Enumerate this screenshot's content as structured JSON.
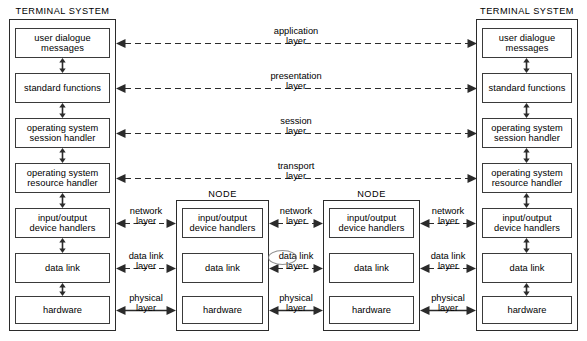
{
  "diagram": {
    "captions": {
      "terminal_system": "TERMINAL SYSTEM",
      "node": "NODE"
    },
    "terminal_stack": [
      {
        "id": "user-dialogue-messages",
        "lines": [
          "user dialogue",
          "messages"
        ]
      },
      {
        "id": "standard-functions",
        "lines": [
          "standard functions"
        ]
      },
      {
        "id": "operating-system-session-handler",
        "lines": [
          "operating system",
          "session handler"
        ]
      },
      {
        "id": "operating-system-resource-handler",
        "lines": [
          "operating system",
          "resource handler"
        ]
      },
      {
        "id": "input-output-device-handlers",
        "lines": [
          "input/output",
          "device handlers"
        ]
      },
      {
        "id": "data-link",
        "lines": [
          "data link"
        ]
      },
      {
        "id": "hardware",
        "lines": [
          "hardware"
        ]
      }
    ],
    "node_stack": [
      {
        "id": "input-output-device-handlers",
        "lines": [
          "input/output",
          "device handlers"
        ]
      },
      {
        "id": "data-link",
        "lines": [
          "data link"
        ]
      },
      {
        "id": "hardware",
        "lines": [
          "hardware"
        ]
      }
    ],
    "end_to_end_layers": [
      {
        "id": "application-layer",
        "l1": "application",
        "l2": "layer"
      },
      {
        "id": "presentation-layer",
        "l1": "presentation",
        "l2": "layer"
      },
      {
        "id": "session-layer",
        "l1": "session",
        "l2": "layer"
      },
      {
        "id": "transport-layer",
        "l1": "transport",
        "l2": "layer"
      }
    ],
    "hop_layers": [
      {
        "id": "network-layer",
        "l1": "network",
        "l2": "layer",
        "style": "dashed"
      },
      {
        "id": "data-link-layer",
        "l1": "data link",
        "l2": "layer",
        "style": "dashed"
      },
      {
        "id": "physical-layer",
        "l1": "physical",
        "l2": "layer",
        "style": "solid"
      }
    ],
    "colors": {
      "line": "#2b2b2b",
      "box_border": "#3a3a3a",
      "background": "#ffffff",
      "text": "#000000"
    }
  }
}
